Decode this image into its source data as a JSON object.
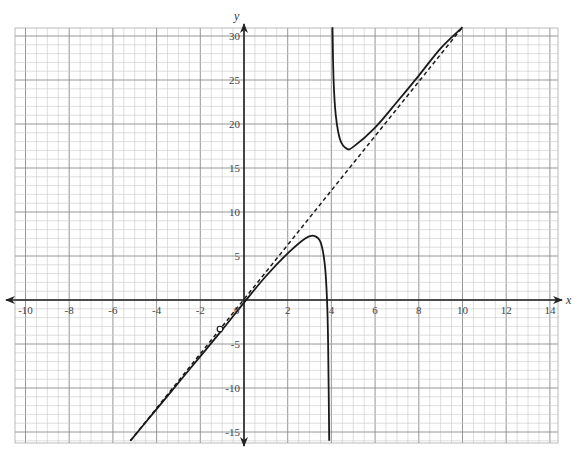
{
  "chart_data": {
    "type": "line",
    "title": "",
    "xlabel": "x",
    "ylabel": "y",
    "xlim": [
      -10.3,
      14.6
    ],
    "ylim": [
      -16,
      31
    ],
    "grid": true,
    "grid_minor_x": 0.5,
    "grid_minor_y": 1,
    "grid_major_x": 2,
    "grid_major_y": 5,
    "x_ticks": [
      -10,
      -8,
      -6,
      -4,
      -2,
      0,
      2,
      4,
      6,
      8,
      10,
      12,
      14
    ],
    "x_tick_labels": [
      "-10",
      "-8",
      "-6",
      "-4",
      "-2",
      "0",
      "2",
      "4",
      "6",
      "8",
      "10",
      "12",
      "14"
    ],
    "y_ticks": [
      -15,
      -10,
      -5,
      5,
      10,
      15,
      20,
      25,
      30
    ],
    "y_tick_labels": [
      "-15",
      "-10",
      "-5",
      "5",
      "10",
      "15",
      "20",
      "25",
      "30"
    ],
    "series": [
      {
        "name": "f(x) left branch",
        "style": "solid",
        "points": [
          [
            -5.2,
            -16
          ],
          [
            -4,
            -12.4
          ],
          [
            -3,
            -9.4
          ],
          [
            -2,
            -6.4
          ],
          [
            -1,
            -3.4
          ],
          [
            0,
            -0.3
          ],
          [
            1,
            2.7
          ],
          [
            2,
            5.3
          ],
          [
            2.8,
            7.0
          ],
          [
            3.2,
            7.3
          ],
          [
            3.5,
            6.6
          ],
          [
            3.7,
            4
          ],
          [
            3.8,
            0
          ],
          [
            3.85,
            -5
          ],
          [
            3.9,
            -16
          ]
        ]
      },
      {
        "name": "f(x) right branch",
        "style": "solid",
        "points": [
          [
            4.05,
            31
          ],
          [
            4.1,
            25
          ],
          [
            4.2,
            21
          ],
          [
            4.4,
            18.2
          ],
          [
            4.7,
            17.2
          ],
          [
            5,
            17.4
          ],
          [
            6,
            19.6
          ],
          [
            7,
            22.5
          ],
          [
            8,
            25.5
          ],
          [
            9,
            28.6
          ],
          [
            10,
            31
          ]
        ]
      },
      {
        "name": "slant asymptote",
        "style": "dashed",
        "points": [
          [
            -5.2,
            -16
          ],
          [
            10,
            31
          ]
        ]
      },
      {
        "name": "vertical asymptote x=4",
        "style": "dashed-light",
        "points": [
          [
            4,
            -16
          ],
          [
            4,
            31
          ]
        ]
      }
    ],
    "annotations": [
      {
        "type": "open-circle",
        "x": -1.1,
        "y": -3.3,
        "label": "hole"
      }
    ]
  },
  "axes": {
    "x_name": "x",
    "y_name": "y",
    "origin_label": "0"
  }
}
